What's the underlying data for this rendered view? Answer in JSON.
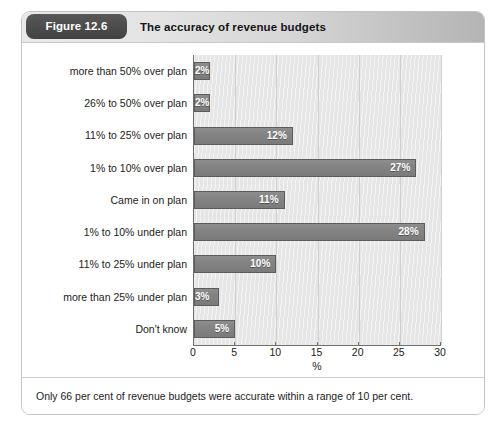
{
  "figure": {
    "number_label": "Figure 12.6",
    "title": "The accuracy of revenue budgets",
    "footnote": "Only 66 per cent of revenue budgets were accurate within a range of 10 per cent."
  },
  "colors": {
    "bar_fill": "#838383",
    "bar_border": "#5d5d5d",
    "plot_background": "#e6e6e6",
    "pill_background": "#4d4d4d",
    "header_gradient_start": "#e8e8e8",
    "header_gradient_end": "#b4b4b4",
    "axis_line": "#6e6e6e",
    "value_label": "#ffffff"
  },
  "chart_data": {
    "type": "bar",
    "orientation": "horizontal",
    "title": "The accuracy of revenue budgets",
    "xlabel": "%",
    "ylabel": "",
    "xlim": [
      0,
      30
    ],
    "xticks": [
      0,
      5,
      10,
      15,
      20,
      25,
      30
    ],
    "xtick_labels": [
      "0",
      "5",
      "10",
      "15",
      "20",
      "25",
      "30"
    ],
    "grid": "vertical",
    "legend": "none",
    "categories": [
      "more than 50% over plan",
      "26% to 50% over plan",
      "11% to 25% over plan",
      "1% to 10% over plan",
      "Came in on plan",
      "1% to 10% under plan",
      "11% to 25% under plan",
      "more than 25% under plan",
      "Don't know"
    ],
    "values": [
      2,
      2,
      12,
      27,
      11,
      28,
      10,
      3,
      5
    ],
    "value_labels": [
      "2%",
      "2%",
      "12%",
      "27%",
      "11%",
      "28%",
      "10%",
      "3%",
      "5%"
    ]
  }
}
